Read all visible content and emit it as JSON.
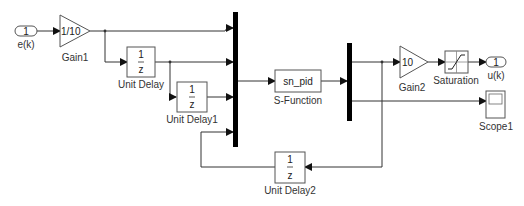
{
  "diagram": {
    "type": "simulink-model",
    "blocks": {
      "inport": {
        "number": "1",
        "name": "e(k)"
      },
      "gain1": {
        "value": "1/10",
        "name": "Gain1"
      },
      "unit_delay": {
        "num": "1",
        "den": "z",
        "name": "Unit Delay"
      },
      "unit_delay1": {
        "num": "1",
        "den": "z",
        "name": "Unit Delay1"
      },
      "unit_delay2": {
        "num": "1",
        "den": "z",
        "name": "Unit Delay2"
      },
      "sfunction": {
        "value": "sn_pid",
        "name": "S-Function"
      },
      "gain2": {
        "value": "10",
        "name": "Gain2"
      },
      "saturation": {
        "name": "Saturation"
      },
      "outport": {
        "number": "1",
        "name": "u(k)"
      },
      "scope": {
        "name": "Scope1"
      }
    },
    "connections": [
      "e(k) -> Gain1",
      "Gain1 -> Mux1.in1",
      "Gain1 -> Unit Delay",
      "Unit Delay -> Mux1.in2",
      "Unit Delay -> Unit Delay1",
      "Unit Delay1 -> Mux1.in3",
      "Unit Delay2 -> Mux1.in4",
      "Mux1 -> S-Function",
      "S-Function -> Demux",
      "Demux.out1 -> Gain2",
      "Demux.out1 -> Unit Delay2",
      "Gain2 -> Saturation",
      "Saturation -> u(k)",
      "Demux.out2 -> Scope1"
    ]
  }
}
